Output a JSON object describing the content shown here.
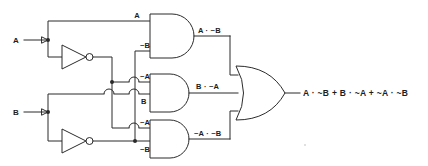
{
  "diagram": {
    "type": "logic-circuit-schematic",
    "canvas": {
      "width": 428,
      "height": 166
    },
    "colors": {
      "background": "#ffffff",
      "wire": "#2b2b2b",
      "text": "#1d1d1d",
      "gate_fill": "#ffffff"
    }
  },
  "inputs": [
    {
      "id": "input-a",
      "label": "A",
      "y": 40
    },
    {
      "id": "input-b",
      "label": "B",
      "y": 112
    }
  ],
  "inverters": [
    {
      "id": "inverter-a",
      "input_signal": "A",
      "output_signal": "~A"
    },
    {
      "id": "inverter-b",
      "input_signal": "B",
      "output_signal": "~B"
    }
  ],
  "wire_labels": {
    "top_and_in1": "A",
    "top_and_in2": "~B",
    "mid_and_in1": "~A",
    "mid_and_in2": "B",
    "bot_and_in1": "~A",
    "bot_and_in2": "~B"
  },
  "gates": [
    {
      "id": "and-gate-top",
      "kind": "AND",
      "inputs": [
        "A",
        "~B"
      ],
      "output_label": "A · ~B"
    },
    {
      "id": "and-gate-middle",
      "kind": "AND",
      "inputs": [
        "~A",
        "B"
      ],
      "output_label": "B · ~A"
    },
    {
      "id": "and-gate-bottom",
      "kind": "AND",
      "inputs": [
        "~A",
        "~B"
      ],
      "output_label": "~A · ~B"
    },
    {
      "id": "or-gate",
      "kind": "OR",
      "inputs": [
        "A · ~B",
        "B · ~A",
        "~A · ~B"
      ],
      "output_label": "A · ~B + B · ~A + ~A · ~B"
    }
  ],
  "output": {
    "id": "circuit-output",
    "expression": "A · ~B + B · ~A + ~A · ~B"
  }
}
